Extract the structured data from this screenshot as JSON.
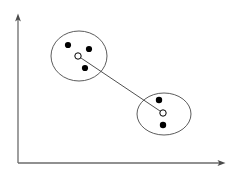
{
  "figure": {
    "width": 236,
    "height": 182,
    "background_color": "#ffffff"
  },
  "colors": {
    "axis": "#6b6b6b",
    "ellipse_stroke": "#4a4a4a",
    "point_fill": "#000000",
    "centroid_stroke": "#000000",
    "centroid_fill": "#ffffff",
    "link_stroke": "#3c3c3c"
  },
  "axes": {
    "origin": {
      "x": 18,
      "y": 163
    },
    "y_axis": {
      "x": 18,
      "y_top": 18,
      "y_bottom": 163,
      "arrow": "arrow-up",
      "label": ""
    },
    "x_axis": {
      "y": 163,
      "x_left": 18,
      "x_right": 221,
      "arrow": "arrow-right",
      "label": ""
    },
    "ticks": [],
    "gridlines": false
  },
  "chart_data": {
    "type": "scatter",
    "title": "",
    "xlabel": "",
    "ylabel": "",
    "xlim": [
      18,
      221
    ],
    "ylim": [
      18,
      163
    ],
    "grid": false,
    "legend": null,
    "clusters": [
      {
        "name": "cluster-1",
        "ellipse": {
          "cx": 79,
          "cy": 56,
          "rx": 28,
          "ry": 25,
          "rotation": 0
        },
        "centroid": {
          "x": 78,
          "y": 56,
          "r": 3.2,
          "style": "open"
        },
        "points": [
          {
            "x": 68,
            "y": 45,
            "r": 3.1
          },
          {
            "x": 89,
            "y": 49,
            "r": 3.1
          },
          {
            "x": 85,
            "y": 68,
            "r": 3.1
          }
        ]
      },
      {
        "name": "cluster-2",
        "ellipse": {
          "cx": 164,
          "cy": 114,
          "rx": 27,
          "ry": 21,
          "rotation": 0
        },
        "centroid": {
          "x": 163,
          "y": 113,
          "r": 3.2,
          "style": "open"
        },
        "points": [
          {
            "x": 159,
            "y": 100,
            "r": 3.2
          },
          {
            "x": 163,
            "y": 125,
            "r": 3.2
          }
        ]
      }
    ],
    "links": [
      {
        "name": "centroid-link",
        "from": {
          "x": 78,
          "y": 56
        },
        "to": {
          "x": 163,
          "y": 113
        },
        "stroke_width": 0.9
      }
    ]
  }
}
